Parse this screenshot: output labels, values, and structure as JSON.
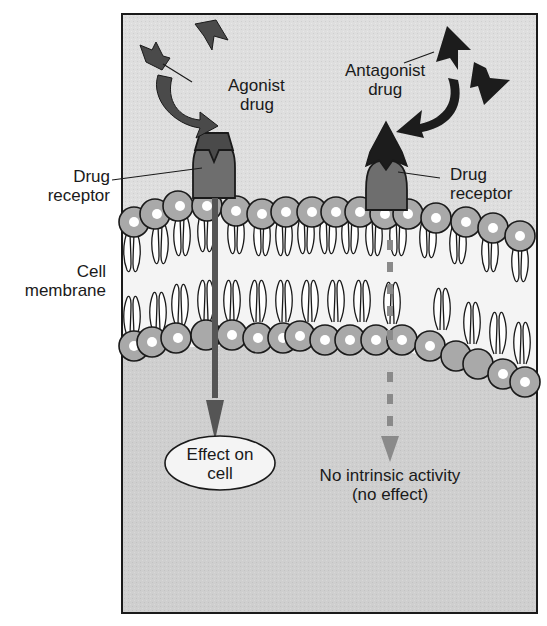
{
  "diagram": {
    "colors": {
      "frame_bg": "#dcdcdc",
      "cytoplasm": "#cfcfcf",
      "membrane_interior": "#f4f4f4",
      "head_fill": "#a9a9a9",
      "head_core": "#ffffff",
      "receptor": "#6e6e6e",
      "agonist": "#4a4a4a",
      "antagonist": "#1c1c1c",
      "dashed_arrow": "#8a8a8a",
      "outline": "#1a1a1a"
    },
    "labels": {
      "agonist": [
        "Agonist",
        "drug"
      ],
      "antagonist": [
        "Antagonist",
        "drug"
      ],
      "receptor_left": [
        "Drug",
        "receptor"
      ],
      "receptor_right": [
        "Drug",
        "receptor"
      ],
      "membrane": [
        "Cell",
        "membrane"
      ],
      "effect": [
        "Effect on",
        "cell"
      ],
      "no_effect": [
        "No intrinsic activity",
        "(no effect)"
      ]
    }
  }
}
